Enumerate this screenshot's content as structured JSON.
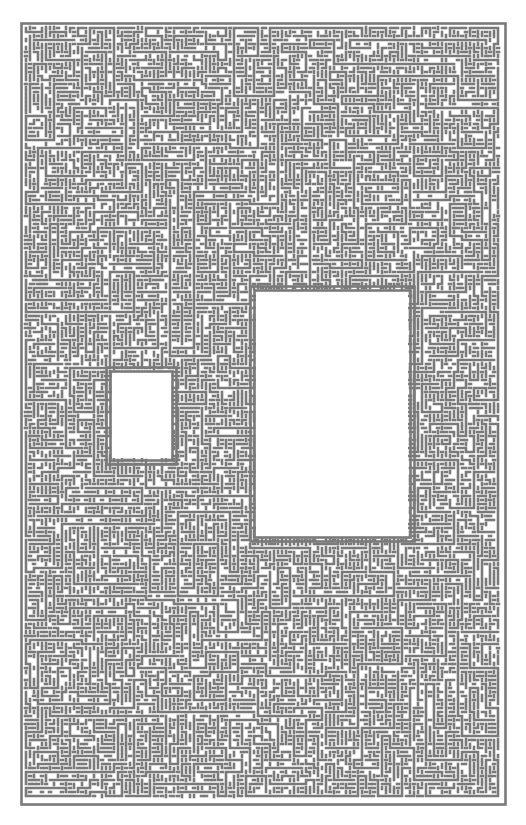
{
  "artwork": {
    "kind": "generative maze / circuit-like line pattern",
    "canvas": {
      "width": 526,
      "height": 825
    },
    "background": "#ffffff",
    "line_color": "#7a7a7a",
    "pitch_px": 4,
    "line_width_px": 2.6,
    "outer_block": {
      "x": 20,
      "y": 22,
      "w": 486,
      "h": 783
    },
    "holes": [
      {
        "name": "small-hole",
        "x": 112,
        "y": 373,
        "w": 58,
        "h": 85
      },
      {
        "name": "large-hole",
        "x": 256,
        "y": 292,
        "w": 152,
        "h": 243
      }
    ],
    "seed": 1971
  }
}
